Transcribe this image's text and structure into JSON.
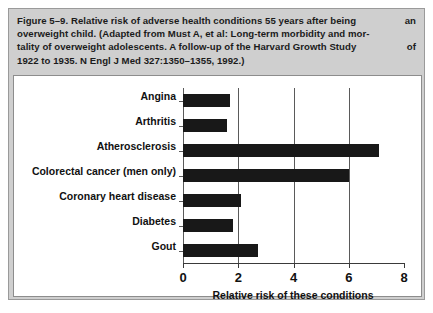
{
  "figure": {
    "caption_lines": [
      "Figure 5–9. Relative risk of adverse health conditions 55 years after being an",
      "overweight child. (Adapted from Must A, et al: Long-term morbidity and mor-",
      "tality of overweight adolescents. A follow-up of the Harvard Growth Study of",
      "1922 to 1935. N Engl J Med 327:1350–1355, 1992.)"
    ],
    "caption_line1_left": "Figure 5–9. Relative risk of adverse health conditions 55 years after being",
    "caption_line1_right": "an",
    "caption_line3_left": "tality of overweight adolescents. A follow-up of the Harvard Growth Study",
    "caption_line3_right": "of"
  },
  "colors": {
    "caption_background": "#cfcfcf",
    "panel_background": "#ffffff",
    "bar_fill": "#181818",
    "grid": "#5a5a5a",
    "axis": "#3a3a3a",
    "border": "#8d8d8d"
  },
  "chart_data": {
    "type": "bar",
    "orientation": "horizontal",
    "title": "",
    "subtitle": "",
    "xlabel": "Relative risk of these conditions",
    "ylabel": "",
    "categories": [
      "Angina",
      "Arthritis",
      "Atherosclerosis",
      "Colorectal cancer (men only)",
      "Coronary heart disease",
      "Diabetes",
      "Gout"
    ],
    "values": [
      1.7,
      1.6,
      7.1,
      6.0,
      2.1,
      1.8,
      2.7
    ],
    "xlim": [
      0,
      8
    ],
    "xticks": [
      0,
      2,
      4,
      6,
      8
    ],
    "xtick_labels": [
      "0",
      "2",
      "4",
      "6",
      "8"
    ],
    "gridlines_x": [
      2,
      4,
      6
    ],
    "grid": true,
    "legend": null,
    "legend_position": "none"
  }
}
